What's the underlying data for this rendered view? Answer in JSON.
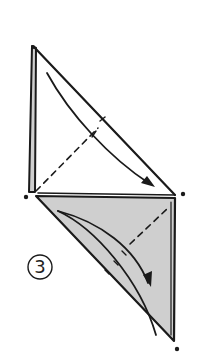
{
  "diagram": {
    "type": "origami-fold-step",
    "step": {
      "number_label": "③"
    },
    "colors": {
      "line": "#1a1a1a",
      "fill_shaded": "#cfcfcf",
      "background": "#ffffff"
    },
    "elements": [
      {
        "name": "upper-triangle",
        "kind": "outline"
      },
      {
        "name": "upper-left-edge-strip",
        "kind": "shaded-strip"
      },
      {
        "name": "upper-fold-arrow",
        "kind": "curved-arrow"
      },
      {
        "name": "upper-dashed-fold-line",
        "kind": "valley-fold"
      },
      {
        "name": "lower-shaded-triangle",
        "kind": "shaded-flap"
      },
      {
        "name": "lower-fold-arrow",
        "kind": "curved-arrow"
      },
      {
        "name": "lower-dashed-fold-line",
        "kind": "valley-fold"
      },
      {
        "name": "reference-dots",
        "count": 3
      }
    ]
  }
}
